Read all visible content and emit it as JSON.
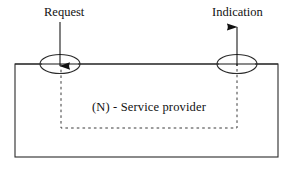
{
  "diagram": {
    "labels": {
      "request": "Request",
      "indication": "Indication",
      "service_provider": "(N) - Service  provider"
    },
    "colors": {
      "background": "#ffffff",
      "stroke": "#2b2b2b",
      "dashed_stroke": "#3a3a3a",
      "arrow_fill": "#111111",
      "text": "#111111"
    },
    "shapes": {
      "outer_rectangle": {
        "x": 15,
        "y": 64,
        "width": 263,
        "height": 93,
        "style": "solid"
      },
      "inner_dashed_rectangle": {
        "x": 61,
        "y": 64,
        "width": 176,
        "height": 64,
        "style": "dashed"
      },
      "left_ellipse": {
        "cx": 60,
        "cy": 64,
        "rx": 20,
        "ry": 9.5
      },
      "right_ellipse": {
        "cx": 237,
        "cy": 64,
        "rx": 20,
        "ry": 9.5
      },
      "horizontal_connector": {
        "x1": 80,
        "y1": 64,
        "x2": 217,
        "y2": 64
      },
      "request_arrow": {
        "x": 60,
        "y_start": 22,
        "y_end": 66,
        "direction": "down"
      },
      "indication_arrow": {
        "x": 237,
        "y_start": 66,
        "y_end": 27,
        "direction": "up"
      }
    }
  }
}
